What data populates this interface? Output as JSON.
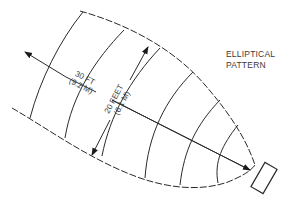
{
  "diagram": {
    "title_line1": "ELLIPTICAL",
    "title_line2": "PATTERN",
    "length_label_ft": "30 FT",
    "length_label_m": "(9.2 M)",
    "width_label_ft": "20 FEET",
    "width_label_m": "(6.1 M)",
    "colors": {
      "line": "#2a2a2a",
      "text": "#3a3a3a",
      "background": "#ffffff"
    }
  }
}
